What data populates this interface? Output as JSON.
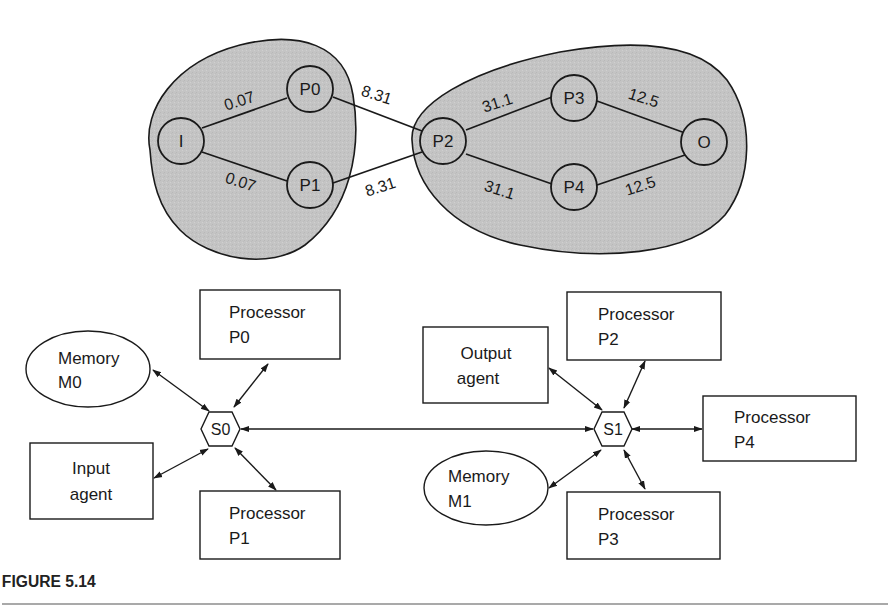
{
  "figure": {
    "caption": "FIGURE 5.14"
  },
  "graph": {
    "nodes": [
      {
        "id": "I",
        "label": "I"
      },
      {
        "id": "P0",
        "label": "P0"
      },
      {
        "id": "P1",
        "label": "P1"
      },
      {
        "id": "P2",
        "label": "P2"
      },
      {
        "id": "P3",
        "label": "P3"
      },
      {
        "id": "P4",
        "label": "P4"
      },
      {
        "id": "O",
        "label": "O"
      }
    ],
    "edges": [
      {
        "from": "I",
        "to": "P0",
        "weight": "0.07"
      },
      {
        "from": "I",
        "to": "P1",
        "weight": "0.07"
      },
      {
        "from": "P0",
        "to": "P2",
        "weight": "8.31"
      },
      {
        "from": "P1",
        "to": "P2",
        "weight": "8.31"
      },
      {
        "from": "P2",
        "to": "P3",
        "weight": "31.1"
      },
      {
        "from": "P2",
        "to": "P4",
        "weight": "31.1"
      },
      {
        "from": "P3",
        "to": "O",
        "weight": "12.5"
      },
      {
        "from": "P4",
        "to": "O",
        "weight": "12.5"
      }
    ],
    "clusters": [
      {
        "name": "cluster-left",
        "members": [
          "I",
          "P0",
          "P1"
        ]
      },
      {
        "name": "cluster-right",
        "members": [
          "P2",
          "P3",
          "P4",
          "O"
        ]
      }
    ]
  },
  "architecture": {
    "switches": [
      {
        "id": "S0",
        "label": "S0"
      },
      {
        "id": "S1",
        "label": "S1"
      }
    ],
    "components": {
      "memory_m0": {
        "line1": "Memory",
        "line2": "M0"
      },
      "processor_p0": {
        "line1": "Processor",
        "line2": "P0"
      },
      "input_agent": {
        "line1": "Input",
        "line2": "agent"
      },
      "processor_p1": {
        "line1": "Processor",
        "line2": "P1"
      },
      "output_agent": {
        "line1": "Output",
        "line2": "agent"
      },
      "processor_p2": {
        "line1": "Processor",
        "line2": "P2"
      },
      "processor_p4": {
        "line1": "Processor",
        "line2": "P4"
      },
      "memory_m1": {
        "line1": "Memory",
        "line2": "M1"
      },
      "processor_p3": {
        "line1": "Processor",
        "line2": "P3"
      }
    }
  }
}
